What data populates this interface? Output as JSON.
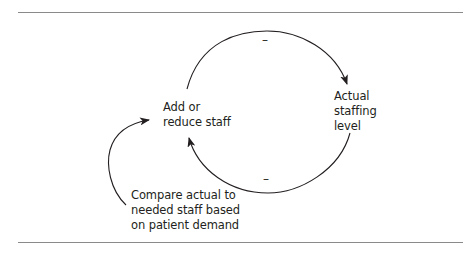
{
  "diagram": {
    "type": "feedback-loop",
    "nodes": [
      {
        "id": "add_reduce",
        "label": "Add or\nreduce staff"
      },
      {
        "id": "actual_level",
        "label": "Actual\nstaffing\nlevel"
      },
      {
        "id": "compare",
        "label": "Compare actual to\nneeded staff based\non patient demand"
      }
    ],
    "edges": [
      {
        "from": "add_reduce",
        "to": "actual_level",
        "polarity": "–"
      },
      {
        "from": "actual_level",
        "to": "add_reduce",
        "polarity": "–"
      },
      {
        "from": "compare",
        "to": "add_reduce",
        "polarity": ""
      }
    ],
    "colors": {
      "line": "#231f20",
      "rule": "#8a8a8a"
    }
  }
}
